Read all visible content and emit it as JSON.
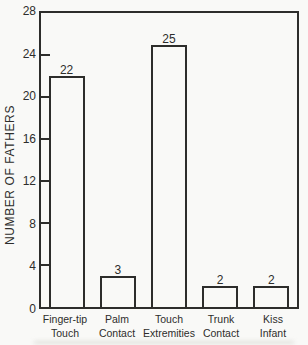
{
  "figure": {
    "background_color": "#f9f9f7",
    "ink_color": "#2d2d2b"
  },
  "chart_data": {
    "type": "bar",
    "title": "",
    "xlabel": "",
    "ylabel": "NUMBER OF FATHERS",
    "ylim": [
      0,
      28
    ],
    "yticks": [
      0,
      4,
      8,
      12,
      16,
      20,
      24,
      28
    ],
    "categories": [
      "Finger-tip\nTouch",
      "Palm\nContact",
      "Touch\nExtremities",
      "Trunk\nContact",
      "Kiss\nInfant"
    ],
    "values": [
      22,
      3,
      25,
      2,
      2
    ],
    "bar_value_labels": [
      "22",
      "3",
      "25",
      "2",
      "2"
    ],
    "grid": false,
    "legend_position": "none",
    "bar_fill": "white-outline",
    "tick_direction": "in"
  }
}
